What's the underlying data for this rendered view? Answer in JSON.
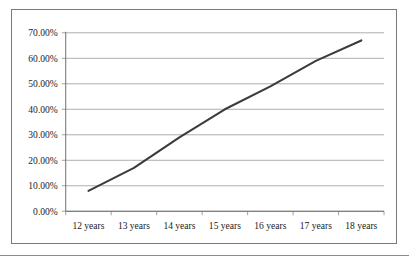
{
  "figure": {
    "border_color": "#7a7a7a",
    "background": "#ffffff"
  },
  "rule": {
    "color": "#8c8c8c"
  },
  "chart_data": {
    "type": "line",
    "title": "",
    "subtitle": "",
    "xlabel": "",
    "ylabel": "",
    "categories": [
      "12 years",
      "13 years",
      "14 years",
      "15 years",
      "16 years",
      "17 years",
      "18 years"
    ],
    "values": [
      8.0,
      17.0,
      29.0,
      40.0,
      49.0,
      59.0,
      67.0
    ],
    "value_format": "percent",
    "ylim": [
      0,
      70
    ],
    "ytick_values": [
      0,
      10,
      20,
      30,
      40,
      50,
      60,
      70
    ],
    "ytick_labels": [
      "0.00%",
      "10.00%",
      "20.00%",
      "30.00%",
      "40.00%",
      "50.00%",
      "60.00%",
      "70.00%"
    ],
    "grid": true,
    "grid_axis": "y",
    "legend": false,
    "legend_position": "none",
    "series": [
      {
        "name": "",
        "color": "#3c3c3c",
        "values": [
          8.0,
          17.0,
          29.0,
          40.0,
          49.0,
          59.0,
          67.0
        ]
      }
    ],
    "annotations": []
  }
}
